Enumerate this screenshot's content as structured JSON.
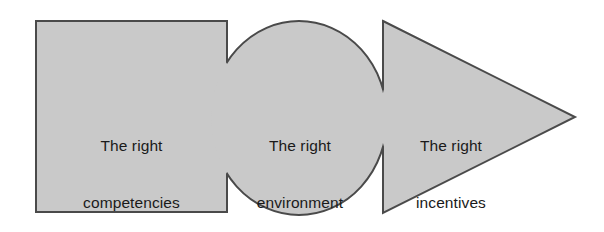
{
  "diagram": {
    "background_color": "#ffffff",
    "shape_fill_color": "#c9c9c9",
    "shape_stroke_color": "#4a4a4a",
    "text_color": "#1a1a1a",
    "shapes": [
      {
        "id": "competencies",
        "type": "rectangle",
        "label_line1": "The right",
        "label_line2": "competencies",
        "x": 36,
        "y": 21,
        "width": 191,
        "height": 191
      },
      {
        "id": "environment",
        "type": "ellipse",
        "label_line1": "The right",
        "label_line2": "environment",
        "cx": 299,
        "cy": 118,
        "rx": 88,
        "ry": 97
      },
      {
        "id": "incentives",
        "type": "triangle",
        "label_line1": "The right",
        "label_line2": "incentives",
        "points": "383,21 575,117 383,213"
      }
    ]
  }
}
